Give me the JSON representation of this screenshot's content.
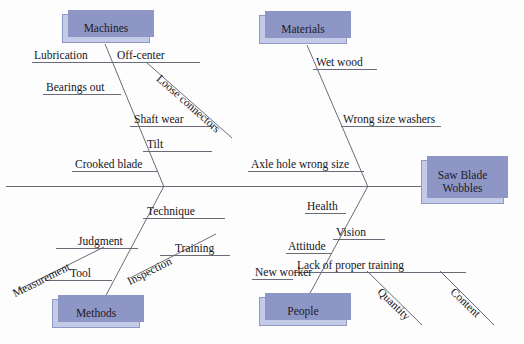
{
  "diagram": {
    "type": "fishbone-ishikawa",
    "problem": {
      "label": "Saw Blade\nWobbles",
      "line1": "Saw Blade",
      "line2": "Wobbles"
    },
    "palette": {
      "box_fill": "#c3cbe8",
      "box_border": "#8f98c4",
      "box_shadow": "#8e96c6",
      "line": "#6b6b78",
      "text": "#15151c",
      "background": "#fdfdfd"
    },
    "categories": [
      {
        "name": "Machines",
        "position": "top-left",
        "causes": [
          {
            "label": "Lubrication",
            "kind": "horizontal"
          },
          {
            "label": "Off-center",
            "kind": "horizontal"
          },
          {
            "label": "Bearings out",
            "kind": "horizontal"
          },
          {
            "label": "Shaft wear",
            "kind": "horizontal"
          },
          {
            "label": "Tilt",
            "kind": "horizontal"
          },
          {
            "label": "Crooked blade",
            "kind": "horizontal"
          },
          {
            "label": "Loose connectors",
            "kind": "diagonal",
            "parent": "Off-center"
          }
        ]
      },
      {
        "name": "Materials",
        "position": "top-right",
        "causes": [
          {
            "label": "Wet wood",
            "kind": "horizontal"
          },
          {
            "label": "Wrong size washers",
            "kind": "horizontal"
          },
          {
            "label": "Axle hole wrong size",
            "kind": "horizontal"
          }
        ]
      },
      {
        "name": "Methods",
        "position": "bottom-left",
        "causes": [
          {
            "label": "Technique",
            "kind": "horizontal"
          },
          {
            "label": "Judgment",
            "kind": "horizontal"
          },
          {
            "label": "Training",
            "kind": "horizontal"
          },
          {
            "label": "Tool",
            "kind": "horizontal"
          },
          {
            "label": "Measurement",
            "kind": "diagonal",
            "parent": "Judgment"
          },
          {
            "label": "Inspection",
            "kind": "diagonal",
            "parent": "Training"
          }
        ]
      },
      {
        "name": "People",
        "position": "bottom-right",
        "causes": [
          {
            "label": "Health",
            "kind": "horizontal"
          },
          {
            "label": "Vision",
            "kind": "horizontal"
          },
          {
            "label": "Attitude",
            "kind": "horizontal"
          },
          {
            "label": "Lack of proper training",
            "kind": "horizontal"
          },
          {
            "label": "New worker",
            "kind": "horizontal"
          },
          {
            "label": "Quantity",
            "kind": "diagonal",
            "parent": "Lack of proper training"
          },
          {
            "label": "Content",
            "kind": "diagonal",
            "parent": "Lack of proper training"
          }
        ]
      }
    ]
  }
}
